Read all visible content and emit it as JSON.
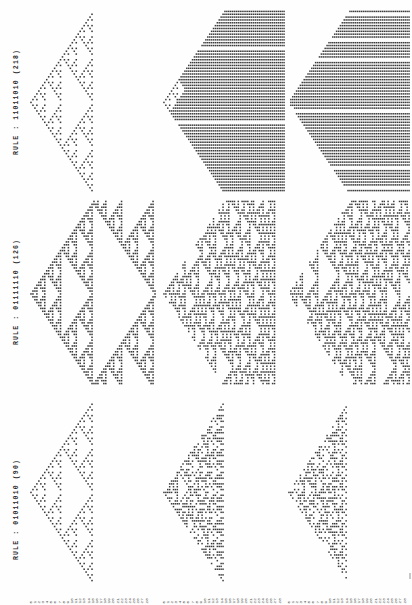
{
  "page": {
    "background_color": "#fefefe",
    "ink_color": "#2e2e2e",
    "orientation": "rotated-90-landscape-print",
    "corner_mark": ""
  },
  "rule_labels": [
    {
      "id": "rule-218",
      "text": "RULE : 11011010  (218)",
      "binary": "11011010",
      "number": 218
    },
    {
      "id": "rule-126",
      "text": "RULE : 01111110  (126)",
      "binary": "01111110",
      "number": 126
    },
    {
      "id": "rule-90",
      "text": "RULE : 01011010  (90)",
      "binary": "01011010",
      "number": 90
    }
  ],
  "axis": {
    "label": "",
    "ticks": [
      "0",
      "1",
      "2",
      "3",
      "4",
      "5",
      "6",
      "7",
      "8",
      "9",
      "10",
      "11",
      "12",
      "13",
      "14",
      "15",
      "16",
      "17",
      "18",
      "19",
      "20",
      "21",
      "22",
      "23",
      "24",
      "25",
      "26",
      "27",
      "28"
    ]
  },
  "chart_data": {
    "type": "heatmap",
    "xlabel": "",
    "ylabel": "",
    "grid": false,
    "legend": "none",
    "note": "Each panel is a binary space-time diagram: rows = successive time steps, columns = cell sites. Filled square = state 1. Panels are rendered rotated 90 degrees so time advances to the right.",
    "panel_grid": {
      "rows": 3,
      "cols": 3
    },
    "panels": [
      {
        "row": 0,
        "col": 0,
        "rule": 218,
        "steps": 64,
        "width": 64,
        "seed": "single-cell",
        "density": 0.22
      },
      {
        "row": 0,
        "col": 1,
        "rule": 218,
        "steps": 64,
        "width": 64,
        "seed": "random-sparse",
        "density": 0.46
      },
      {
        "row": 0,
        "col": 2,
        "rule": 218,
        "steps": 64,
        "width": 64,
        "seed": "random-dense",
        "density": 0.62
      },
      {
        "row": 1,
        "col": 0,
        "rule": 126,
        "steps": 64,
        "width": 64,
        "seed": "single-cell",
        "density": 0.52
      },
      {
        "row": 1,
        "col": 1,
        "rule": 126,
        "steps": 64,
        "width": 64,
        "seed": "random-sparse",
        "density": 0.49
      },
      {
        "row": 1,
        "col": 2,
        "rule": 126,
        "steps": 64,
        "width": 64,
        "seed": "random-dense",
        "density": 0.47
      },
      {
        "row": 2,
        "col": 0,
        "rule": 90,
        "steps": 64,
        "width": 64,
        "seed": "single-cell",
        "density": 0.25
      },
      {
        "row": 2,
        "col": 1,
        "rule": 90,
        "steps": 64,
        "width": 64,
        "seed": "random-sparse",
        "density": 0.33
      },
      {
        "row": 2,
        "col": 2,
        "rule": 90,
        "steps": 64,
        "width": 64,
        "seed": "random-dense",
        "density": 0.38
      }
    ]
  }
}
